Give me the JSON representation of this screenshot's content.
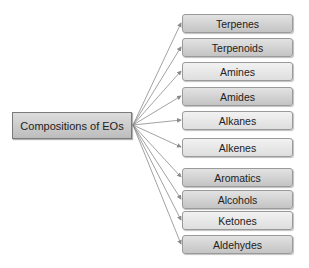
{
  "diagram": {
    "root": {
      "label": "Compositions of EOs"
    },
    "children": [
      {
        "label": "Terpenes",
        "top": 14,
        "shade": "dark"
      },
      {
        "label": "Terpenoids",
        "top": 38,
        "shade": "dark"
      },
      {
        "label": "Amines",
        "top": 62,
        "shade": "light"
      },
      {
        "label": "Amides",
        "top": 87,
        "shade": "dark"
      },
      {
        "label": "Alkanes",
        "top": 111,
        "shade": "light"
      },
      {
        "label": "Alkenes",
        "top": 138,
        "shade": "light"
      },
      {
        "label": "Aromatics",
        "top": 168,
        "shade": "dark"
      },
      {
        "label": "Alcohols",
        "top": 190,
        "shade": "dark"
      },
      {
        "label": "Ketones",
        "top": 211,
        "shade": "light"
      },
      {
        "label": "Aldehydes",
        "top": 235,
        "shade": "dark"
      }
    ],
    "colors": {
      "arrow": "#8a8a8a",
      "border": "#9a9a9a"
    }
  }
}
